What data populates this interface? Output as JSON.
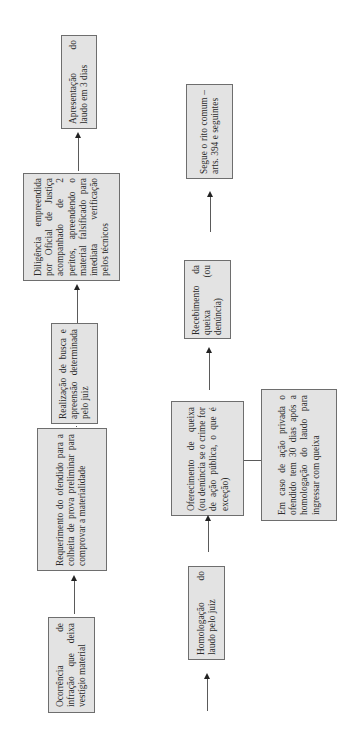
{
  "diagram": {
    "orientation": "rotated -90deg (reads bottom-to-top)",
    "flow_top_row": [
      {
        "id": "ocorrencia",
        "text": "Ocorrência de infração que deixa vestígio material"
      },
      {
        "id": "requerimento",
        "text": "Requerimento do ofendido para a colheita de prova preliminar para comprovar a materialidade"
      },
      {
        "id": "realizacao",
        "text": "Realização de busca e apreensão determinada pelo juiz"
      },
      {
        "id": "diligencia",
        "text": "Diligência empreendida por Oficial de Justiça acompanhado de 2 peritos, apreendendo o material falsificado para imediata verificação pelos técnicos"
      },
      {
        "id": "apresentacao",
        "text": "Apresentação do laudo em 3 dias"
      }
    ],
    "flow_bottom_row": [
      {
        "id": "homologacao",
        "text": "Homologação do laudo pelo juiz"
      },
      {
        "id": "oferecimento",
        "text": "Oferecimento de queixa (ou denúncia se o crime for de ação pública, o que é exceção)"
      },
      {
        "id": "recebimento",
        "text": "Recebimento da queixa (ou denúncia)"
      },
      {
        "id": "segue",
        "text": "Segue o rito comum – arts. 394 e seguintes"
      }
    ],
    "side_note": {
      "id": "em-caso",
      "attached_to": "oferecimento",
      "text": "Em caso de ação privada o ofendido tem 30 dias após a homologação do laudo para ingressar com queixa"
    },
    "colors": {
      "box_fill": "#e3e3e3",
      "box_border": "#6e6e6e",
      "text": "#2a2a2a",
      "connector": "#5a5a5a"
    }
  }
}
